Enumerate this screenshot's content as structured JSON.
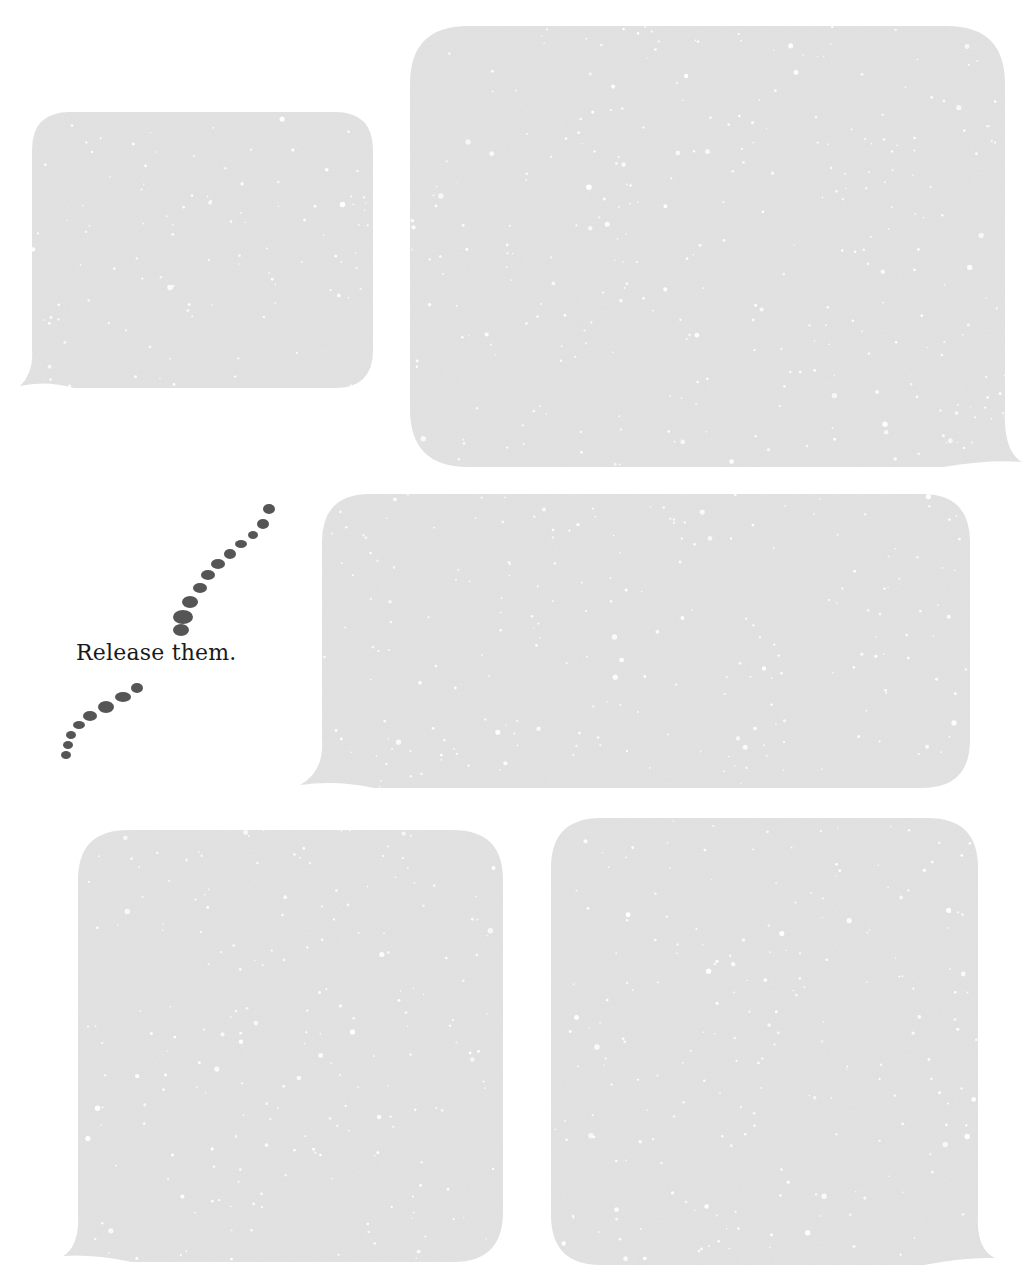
{
  "caption": {
    "text": "Release them."
  },
  "colors": {
    "background": "#ffffff",
    "bubble_fill": "#e3e3e3",
    "bubble_speck": "#ffffff",
    "dot_fill": "#555555",
    "caption_text": "#1a1a1a"
  },
  "bubbles": [
    {
      "id": "bubble-1",
      "x": 32,
      "y": 112,
      "w": 341,
      "h": 276,
      "r": 38,
      "tail": "bottom-left",
      "tail_tip": [
        20,
        386
      ]
    },
    {
      "id": "bubble-2",
      "x": 410,
      "y": 26,
      "w": 595,
      "h": 441,
      "r": 58,
      "tail": "bottom-right",
      "tail_tip": [
        1022,
        462
      ]
    },
    {
      "id": "bubble-3",
      "x": 322,
      "y": 494,
      "w": 648,
      "h": 294,
      "r": 48,
      "tail": "bottom-left",
      "tail_tip": [
        300,
        785
      ]
    },
    {
      "id": "bubble-4",
      "x": 78,
      "y": 830,
      "w": 425,
      "h": 432,
      "r": 50,
      "tail": "bottom-left",
      "tail_tip": [
        63,
        1256
      ]
    },
    {
      "id": "bubble-5",
      "x": 551,
      "y": 818,
      "w": 427,
      "h": 447,
      "r": 50,
      "tail": "bottom-right",
      "tail_tip": [
        995,
        1258
      ]
    }
  ],
  "dots_upper": [
    [
      269,
      509,
      6,
      5
    ],
    [
      263,
      524,
      6,
      5
    ],
    [
      253,
      535,
      5,
      4
    ],
    [
      241,
      544,
      6,
      4
    ],
    [
      230,
      554,
      6,
      5
    ],
    [
      218,
      564,
      7,
      5
    ],
    [
      208,
      575,
      7,
      5
    ],
    [
      200,
      588,
      7,
      5
    ],
    [
      190,
      602,
      8,
      6
    ],
    [
      183,
      617,
      10,
      7
    ],
    [
      181,
      630,
      8,
      6
    ]
  ],
  "dots_lower": [
    [
      137,
      688,
      6,
      5
    ],
    [
      123,
      697,
      8,
      5
    ],
    [
      106,
      707,
      8,
      6
    ],
    [
      90,
      716,
      7,
      5
    ],
    [
      79,
      725,
      6,
      4
    ],
    [
      71,
      735,
      5,
      4
    ],
    [
      68,
      745,
      5,
      4
    ],
    [
      66,
      755,
      5,
      4
    ]
  ]
}
